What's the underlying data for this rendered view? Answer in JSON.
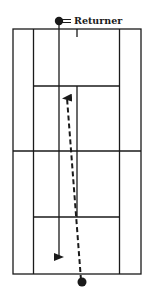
{
  "diagram": {
    "type": "tennis-court-serve-and-return",
    "labels": {
      "returner": "Returner"
    },
    "colors": {
      "line": "#1a1a1a",
      "background": "#ffffff"
    },
    "players": [
      {
        "role": "returner",
        "marker": "filled-circle",
        "position": "top baseline, left of center"
      },
      {
        "role": "server",
        "marker": "filled-circle",
        "position": "bottom baseline, near center"
      }
    ],
    "paths": [
      {
        "name": "serve",
        "style": "dashed",
        "direction": "from server up to opponent service box"
      },
      {
        "name": "returner-movement",
        "style": "solid",
        "direction": "from returner down to own service area"
      }
    ]
  }
}
